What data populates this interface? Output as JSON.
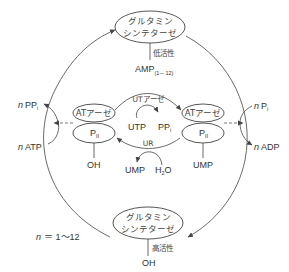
{
  "diagram": {
    "top_enzyme": {
      "line1": "グルタミン",
      "line2": "シンテターゼ",
      "activity": "低活性",
      "modifier": "AMP",
      "modifier_sub": "(1－12)"
    },
    "bottom_enzyme": {
      "line1": "グルタミン",
      "line2": "シンテターゼ",
      "activity": "高活性",
      "modifier": "OH"
    },
    "left_complex": {
      "atase": "ATアーゼ",
      "pii": "P",
      "pii_sub": "II",
      "modifier": "OH"
    },
    "right_complex": {
      "atase": "ATアーゼ",
      "pii": "P",
      "pii_sub": "II",
      "modifier": "UMP"
    },
    "ut_reaction": {
      "enzyme": "UTアーゼ",
      "substrate": "UTP",
      "product": "PP",
      "product_sub": "i"
    },
    "ur_reaction": {
      "enzyme": "UR",
      "product": "UMP",
      "substrate": "H",
      "substrate_sub": "2",
      "substrate_tail": "O"
    },
    "left_side": {
      "n": "n",
      "output": "PP",
      "output_sub": "i",
      "input": "ATP"
    },
    "right_side": {
      "n": "n",
      "output_top": "P",
      "output_top_sub": "i",
      "output_bottom": "ADP"
    },
    "footnote": {
      "n": "n",
      "text": "＝ 1～12"
    }
  }
}
